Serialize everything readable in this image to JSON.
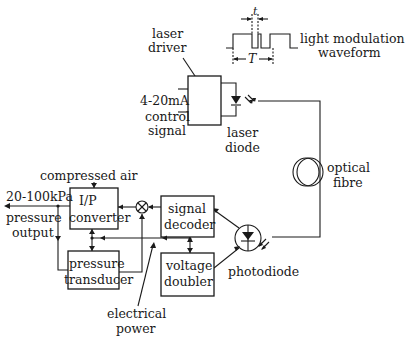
{
  "diagram": {
    "type": "block-diagram",
    "labels": {
      "laser_driver": [
        "laser",
        "driver"
      ],
      "control_signal": [
        "4-20mA",
        "control",
        "signal"
      ],
      "laser_diode": [
        "laser",
        "diode"
      ],
      "light_modulation": [
        "light modulation",
        "waveform"
      ],
      "tau": "t",
      "period": "T",
      "optical_fibre": [
        "optical",
        "fibre"
      ],
      "compressed_air": "compressed air",
      "pressure_range": "20-100kPa",
      "pressure_output": [
        "pressure",
        "output"
      ],
      "ip_converter": [
        "I/P",
        "converter"
      ],
      "pressure_transducer": [
        "pressure",
        "transducer"
      ],
      "signal_decoder": [
        "signal",
        "decoder"
      ],
      "voltage_doubler": [
        "voltage",
        "doubler"
      ],
      "photodiode": "photodiode",
      "electrical_power": [
        "electrical",
        "power"
      ]
    },
    "blocks": [
      "laser driver",
      "I/P converter",
      "pressure transducer",
      "signal decoder",
      "voltage doubler"
    ],
    "components": [
      "laser diode",
      "optical fibre",
      "photodiode",
      "summing junction"
    ],
    "colors": {
      "line": "#1a1a1a",
      "background": "#ffffff"
    }
  }
}
